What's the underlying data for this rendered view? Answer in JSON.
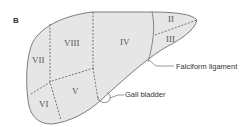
{
  "figure": {
    "panel_label": "B",
    "colors": {
      "fill": "#e6e6e6",
      "outline": "#6e6e6e",
      "dash": "#555555",
      "text": "#333333"
    },
    "segments": [
      {
        "id": "II",
        "label": "II"
      },
      {
        "id": "III",
        "label": "III"
      },
      {
        "id": "IV",
        "label": "IV"
      },
      {
        "id": "V",
        "label": "V"
      },
      {
        "id": "VI",
        "label": "VI"
      },
      {
        "id": "VII",
        "label": "VII"
      },
      {
        "id": "VIII",
        "label": "VIII"
      }
    ],
    "annotations": {
      "falciform": "Falciform ligament",
      "gallbladder": "Gall bladder"
    }
  }
}
